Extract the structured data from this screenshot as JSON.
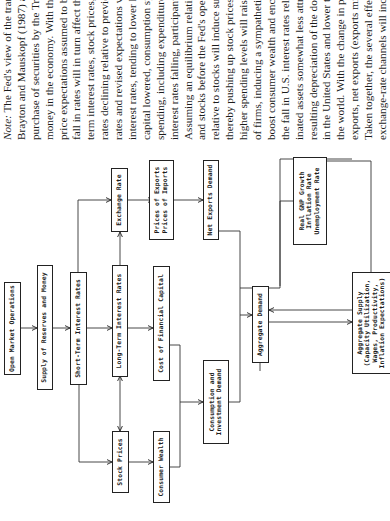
{
  "diagram": {
    "boxes": {
      "open_market_operations": [
        "Open Market Operations"
      ],
      "supply_reserves_money": [
        "Supply of Reserves and Money"
      ],
      "short_term_rates": [
        "Short-Term Interest Rates"
      ],
      "stock_prices": [
        "Stock Prices"
      ],
      "long_term_rates": [
        "Long-Term Interest Rates"
      ],
      "exchange_rate": [
        "Exchange Rate"
      ],
      "consumer_wealth": [
        "Consumer Wealth"
      ],
      "cost_financial_capital": [
        "Cost of Financial Capital"
      ],
      "prices_exports_imports": [
        "Prices of Exports",
        "Prices of Imports"
      ],
      "consumption_investment": [
        "Consumption and",
        "Investment Demand"
      ],
      "net_exports_demand": [
        "Net Exports Demand"
      ],
      "aggregate_demand": [
        "Aggregate Demand"
      ],
      "gnp_inflation_unemployment": [
        "Real GNP Growth",
        "Inflation Rate",
        "Unemployment Rate"
      ],
      "aggregate_supply": [
        "Aggregate Supply",
        "(Capacity Utilization,",
        "Wages, Productivity,",
        "Inflation Expectations)"
      ]
    }
  },
  "note": {
    "label": "Note:",
    "lines": [
      " The Fed's view of the trans",
      "Brayton and Mauskopf (1987) and",
      "purchase of securities by the Tradi",
      "money in the economy. With the s",
      "price expectations assumed to be co",
      "fall in rates will in turn affect the p",
      "term interest rates, stock prices, an",
      "rates declining relative to previous",
      "rates and revised expectations wil",
      "interest rates, tending to lower long",
      "capital lowered, consumption spend",
      "spending, including expenditures o",
      "interest rates falling, participants",
      "Assuming an equilibrium relationsh",
      "and stocks before the Fed's open",
      "relative to stocks will induce substit",
      "thereby pushing up stock prices. P",
      "higher spending levels will raise th",
      "of firms, inducing a sympathetic ri",
      "boost consumer wealth and encoura",
      "the fall in U.S. interest rates relati",
      "inated assets somewhat less attrac",
      "resulting depreciation of the dollar",
      "in the United States and lower the",
      "the world. With the change in pr",
      "exports, net exports (exports minu",
      "Taken together, the several effect",
      "exchange-rate channels will increa",
      "The alteration in aggregate demand",
      "changes in output, employment, a",
      "affects \"quantities\" (output and em",
      "Fed's view, on factors such as ex",
      "productivity growth, and the state"
    ]
  }
}
